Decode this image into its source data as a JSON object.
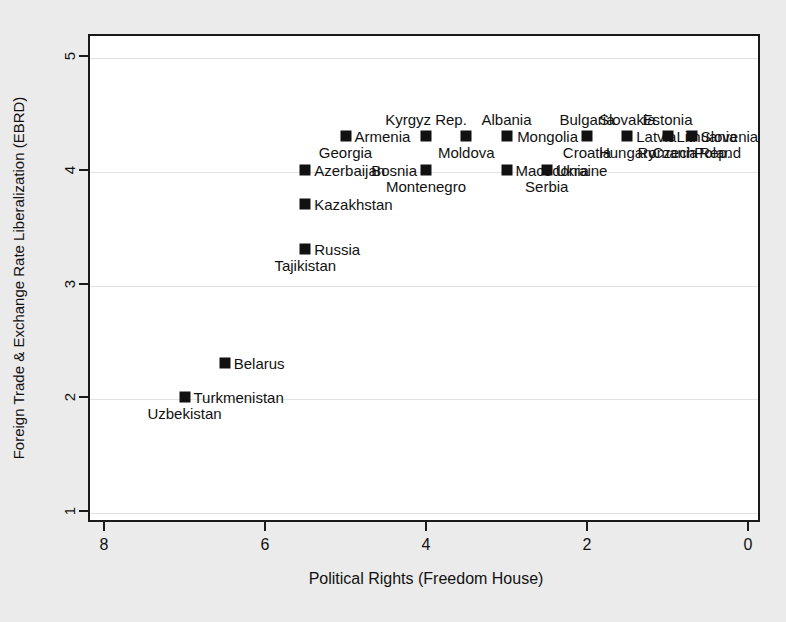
{
  "chart_data": {
    "type": "scatter",
    "title": "",
    "xlabel": "Political Rights (Freedom House)",
    "ylabel": "Foreign Trade & Exchange Rate Liberalization (EBRD)",
    "xlim": [
      8.2,
      -0.2
    ],
    "ylim": [
      0.8,
      5.2
    ],
    "x_axis_reversed": true,
    "xticks": [
      8,
      6,
      4,
      2,
      0
    ],
    "yticks": [
      1,
      2,
      3,
      4,
      5
    ],
    "grid": "horizontal-faint",
    "legend": "none",
    "points": [
      {
        "label": "Uzbekistan",
        "x": 7.0,
        "y": 2.0,
        "label_pos": "below"
      },
      {
        "label": "Turkmenistan",
        "x": 7.0,
        "y": 2.0,
        "label_pos": "right"
      },
      {
        "label": "Belarus",
        "x": 6.5,
        "y": 2.3,
        "label_pos": "right"
      },
      {
        "label": "Tajikistan",
        "x": 5.5,
        "y": 3.3,
        "label_pos": "below"
      },
      {
        "label": "Russia",
        "x": 5.5,
        "y": 3.3,
        "label_pos": "right"
      },
      {
        "label": "Kazakhstan",
        "x": 5.5,
        "y": 3.7,
        "label_pos": "right"
      },
      {
        "label": "Azerbaijan",
        "x": 5.5,
        "y": 4.0,
        "label_pos": "right"
      },
      {
        "label": "Georgia",
        "x": 5.0,
        "y": 4.3,
        "label_pos": "below"
      },
      {
        "label": "Armenia",
        "x": 5.0,
        "y": 4.3,
        "label_pos": "right"
      },
      {
        "label": "Kyrgyz Rep.",
        "x": 4.0,
        "y": 4.3,
        "label_pos": "above"
      },
      {
        "label": "Bosnia",
        "x": 4.0,
        "y": 4.0,
        "label_pos": "left"
      },
      {
        "label": "Montenegro",
        "x": 4.0,
        "y": 4.0,
        "label_pos": "below"
      },
      {
        "label": "Moldova",
        "x": 3.5,
        "y": 4.3,
        "label_pos": "below"
      },
      {
        "label": "Albania",
        "x": 3.0,
        "y": 4.3,
        "label_pos": "above"
      },
      {
        "label": "Macedonia",
        "x": 3.0,
        "y": 4.0,
        "label_pos": "right"
      },
      {
        "label": "Serbia",
        "x": 2.5,
        "y": 4.0,
        "label_pos": "below"
      },
      {
        "label": "Ukraine",
        "x": 2.5,
        "y": 4.0,
        "label_pos": "right"
      },
      {
        "label": "Bulgaria",
        "x": 2.0,
        "y": 4.3,
        "label_pos": "above"
      },
      {
        "label": "Mongolia",
        "x": 2.0,
        "y": 4.3,
        "label_pos": "left"
      },
      {
        "label": "Croatia",
        "x": 2.0,
        "y": 4.3,
        "label_pos": "below"
      },
      {
        "label": "Slovakia",
        "x": 1.5,
        "y": 4.3,
        "label_pos": "above"
      },
      {
        "label": "Latvia",
        "x": 1.5,
        "y": 4.3,
        "label_pos": "right"
      },
      {
        "label": "Hungary",
        "x": 1.5,
        "y": 4.3,
        "label_pos": "below"
      },
      {
        "label": "Estonia",
        "x": 1.0,
        "y": 4.3,
        "label_pos": "above"
      },
      {
        "label": "Lithuania",
        "x": 1.0,
        "y": 4.3,
        "label_pos": "right"
      },
      {
        "label": "Romania",
        "x": 1.0,
        "y": 4.3,
        "label_pos": "below"
      },
      {
        "label": "Slovenia",
        "x": 0.7,
        "y": 4.3,
        "label_pos": "right"
      },
      {
        "label": "Czech Rep.",
        "x": 0.7,
        "y": 4.3,
        "label_pos": "below"
      },
      {
        "label": "Poland",
        "x": 0.7,
        "y": 4.3,
        "label_pos": "belowright"
      }
    ],
    "marker_style": {
      "shape": "square",
      "color": "#111111",
      "size_px": 11
    },
    "colors": {
      "figure_background": "#ebebeb",
      "panel_background": "#ffffff",
      "axis": "#1a1a1a",
      "grid": "#e2e2e2",
      "text": "#111111"
    }
  }
}
